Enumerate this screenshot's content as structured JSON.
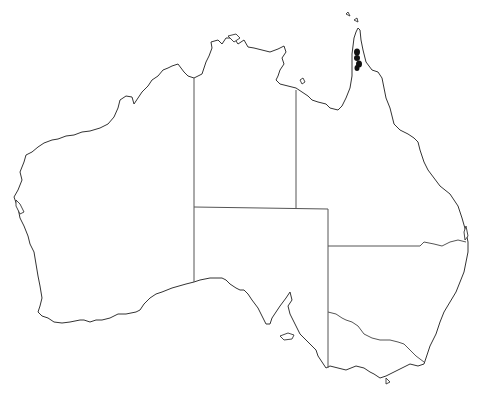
{
  "map": {
    "region": "Australia",
    "style": "outline map with state borders",
    "background_color": "#ffffff",
    "outline_color": "#333333",
    "states": [
      "WA",
      "NT",
      "SA",
      "QLD",
      "NSW",
      "VIC",
      "TAS"
    ],
    "occurrence_records": {
      "color": "#111111",
      "location": "Cape York Peninsula, north-east Queensland",
      "points": [
        {
          "x": 357,
          "y": 52
        },
        {
          "x": 357,
          "y": 58
        },
        {
          "x": 359,
          "y": 64
        },
        {
          "x": 357,
          "y": 68
        }
      ]
    }
  }
}
